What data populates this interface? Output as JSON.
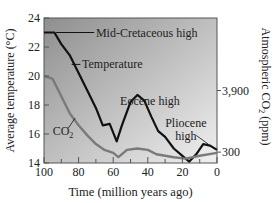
{
  "chart_data": {
    "type": "line",
    "title": "",
    "xlabel": "Time (million years ago)",
    "ylabel": "Average temperature (°C)",
    "ylabel_right": "Atmospheric CO2 (ppm)",
    "xlim": [
      100,
      0
    ],
    "ylim": [
      14,
      24
    ],
    "x_ticks": [
      100,
      80,
      60,
      40,
      20,
      0
    ],
    "y_ticks": [
      14,
      16,
      18,
      20,
      22,
      24
    ],
    "y_right_ticks": [
      {
        "label": "3,900",
        "temp_equiv": 19.0
      },
      {
        "label": "300",
        "temp_equiv": 14.75
      }
    ],
    "grid": false,
    "series": [
      {
        "name": "Temperature",
        "color": "#111111",
        "x": [
          100,
          94,
          90,
          85,
          80,
          75,
          70,
          66,
          62,
          58,
          55,
          50,
          46,
          42,
          38,
          34,
          30,
          25,
          20,
          16,
          12,
          8,
          4,
          0
        ],
        "values": [
          23.0,
          23.0,
          22.2,
          21.4,
          20.2,
          19.0,
          17.8,
          16.6,
          16.7,
          15.5,
          16.6,
          18.2,
          18.7,
          18.3,
          17.2,
          16.2,
          15.8,
          15.0,
          14.5,
          14.1,
          14.6,
          15.3,
          15.2,
          14.9
        ]
      },
      {
        "name": "CO2",
        "color": "#7a7a7a",
        "x": [
          100,
          95,
          90,
          85,
          80,
          75,
          70,
          65,
          60,
          57,
          52,
          46,
          40,
          35,
          25,
          18,
          10,
          0
        ],
        "values": [
          20.0,
          19.8,
          18.6,
          17.4,
          16.6,
          15.9,
          15.3,
          14.9,
          14.7,
          14.4,
          14.9,
          15.0,
          14.9,
          14.6,
          14.4,
          14.3,
          14.5,
          14.7
        ]
      }
    ],
    "annotations": [
      {
        "text": "Mid-Cretaceous high",
        "x": 95,
        "y": 23.0
      },
      {
        "text": "Temperature",
        "x": 85,
        "y": 21.4
      },
      {
        "text": "Eocene high",
        "x": 46,
        "y": 18.7
      },
      {
        "text": "Pliocene high",
        "x": 6,
        "y": 15.3
      },
      {
        "text": "CO2",
        "x": 83,
        "y": 17.1
      }
    ]
  },
  "labels": {
    "mid_cretaceous": "Mid-Cretaceous high",
    "temperature": "Temperature",
    "eocene": "Eocene high",
    "pliocene_1": "Pliocene",
    "pliocene_2": "high",
    "co2": "CO",
    "co2_sub": "2",
    "y_left": "Average temperature (°C)",
    "y_right": "Atmospheric CO",
    "y_right_sub": "2",
    "y_right_unit": " (ppm)",
    "x_axis": "Time (million years ago)"
  }
}
